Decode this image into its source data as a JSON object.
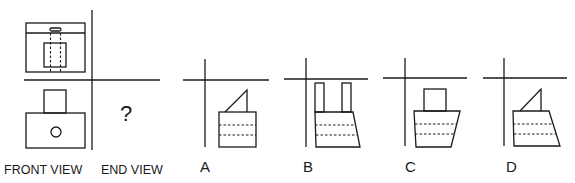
{
  "question": {
    "front_view_label": "FRONT VIEW",
    "end_view_label": "END VIEW",
    "unknown_mark": "?"
  },
  "options": [
    {
      "id": "A",
      "label": "A"
    },
    {
      "id": "B",
      "label": "B"
    },
    {
      "id": "C",
      "label": "C"
    },
    {
      "id": "D",
      "label": "D"
    }
  ],
  "colors": {
    "line": "#1a1a1a",
    "background": "#ffffff"
  }
}
